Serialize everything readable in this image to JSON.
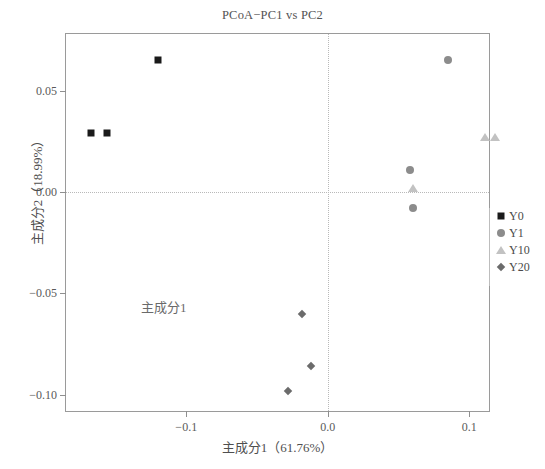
{
  "chart_data": {
    "type": "scatter",
    "title": "PCoA−PC1 vs PC2",
    "xlabel": "主成分1（61.76%）",
    "ylabel": "主成分2（18.99%）",
    "annotation": "主成分1",
    "xlim": [
      -0.185,
      0.114
    ],
    "ylim": [
      -0.108,
      0.078
    ],
    "xticks": [
      -0.1,
      0.0,
      0.1
    ],
    "xticklabels": [
      "−0.1",
      "0.0",
      "0.1"
    ],
    "yticks": [
      0.05,
      0.0,
      -0.05,
      -0.1
    ],
    "yticklabels": [
      "0.05",
      "0.00",
      "−0.05",
      "−0.10"
    ],
    "grid": false,
    "reference_lines": {
      "x": 0.0,
      "y": 0.0,
      "style": "dotted"
    },
    "legend_position": "right",
    "series": [
      {
        "name": "Y0",
        "marker": "square",
        "color": "#1a1a1a",
        "points": [
          {
            "x": -0.12,
            "y": 0.065
          },
          {
            "x": -0.167,
            "y": 0.029
          },
          {
            "x": -0.156,
            "y": 0.029
          }
        ]
      },
      {
        "name": "Y1",
        "marker": "circle",
        "color": "#8c8c8c",
        "points": [
          {
            "x": 0.085,
            "y": 0.065
          },
          {
            "x": 0.058,
            "y": 0.011
          },
          {
            "x": 0.06,
            "y": -0.008
          }
        ]
      },
      {
        "name": "Y10",
        "marker": "triangle",
        "color": "#c2c2c2",
        "points": [
          {
            "x": 0.111,
            "y": 0.027
          },
          {
            "x": 0.118,
            "y": 0.027
          },
          {
            "x": 0.06,
            "y": 0.002
          }
        ]
      },
      {
        "name": "Y20",
        "marker": "diamond",
        "color": "#6b6b6b",
        "points": [
          {
            "x": -0.018,
            "y": -0.06
          },
          {
            "x": -0.012,
            "y": -0.086
          },
          {
            "x": -0.028,
            "y": -0.098
          }
        ]
      }
    ]
  }
}
